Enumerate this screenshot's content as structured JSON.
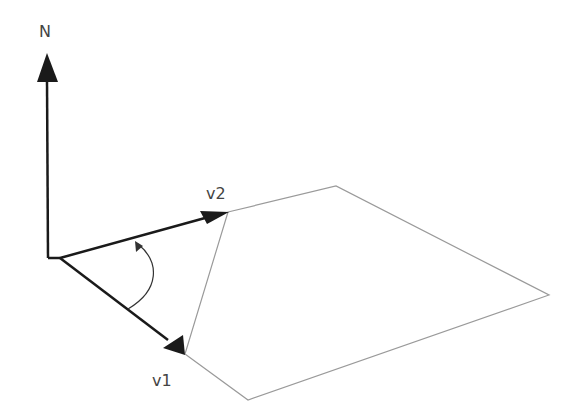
{
  "diagram": {
    "labels": {
      "normal": "N",
      "v1": "v1",
      "v2": "v2"
    },
    "colors": {
      "vector": "#1a1a1a",
      "plane_edge": "#9a9a9a",
      "arc": "#333333",
      "label": "#444444",
      "background": "#ffffff"
    }
  }
}
